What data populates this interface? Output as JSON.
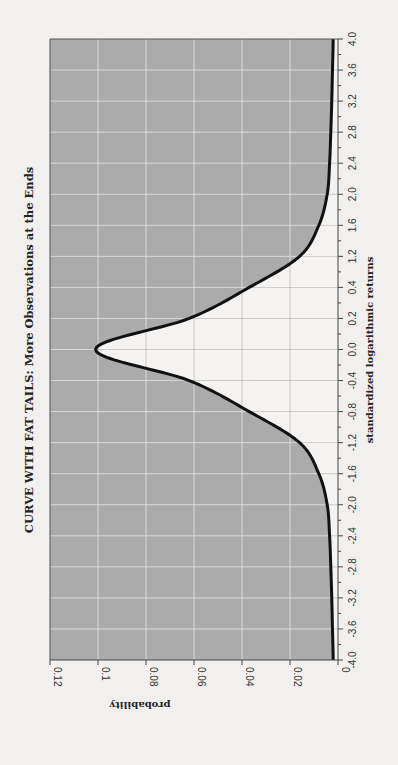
{
  "chart_data": {
    "type": "area",
    "orientation": "rotated-90-clockwise",
    "title": "CURVE WITH FAT TAILS: More Observations at the Ends",
    "xlabel": "standardized logarithmic returns",
    "ylabel": "probability",
    "categories": [
      "4.0",
      "3.6",
      "3.2",
      "2.8",
      "2.4",
      "2.0",
      "1.6",
      "1.2",
      "0.4",
      "0.2",
      "0.0",
      "-0.4",
      "-0.8",
      "-1.2",
      "-1.6",
      "-2.0",
      "-2.4",
      "-2.8",
      "-3.2",
      "-3.6",
      "-4.0"
    ],
    "values": [
      0.002,
      0.0023,
      0.0026,
      0.003,
      0.0035,
      0.0045,
      0.008,
      0.016,
      0.037,
      0.062,
      0.101,
      0.062,
      0.037,
      0.016,
      0.008,
      0.0045,
      0.0035,
      0.003,
      0.0026,
      0.0023,
      0.002
    ],
    "yticks": [
      "0.12",
      "0.1",
      "0.08",
      "0.06",
      "0.04",
      "0.02",
      "0"
    ],
    "ytick_values": [
      0.12,
      0.1,
      0.08,
      0.06,
      0.04,
      0.02,
      0
    ],
    "ylim": [
      0,
      0.12
    ],
    "grid": true,
    "legend": null,
    "colors": {
      "plot_background": "#ababab",
      "area_under_curve": "#f4f3f1",
      "curve": "#111111",
      "grid": "#d6d6d6",
      "page": "#f1f0ee"
    }
  }
}
